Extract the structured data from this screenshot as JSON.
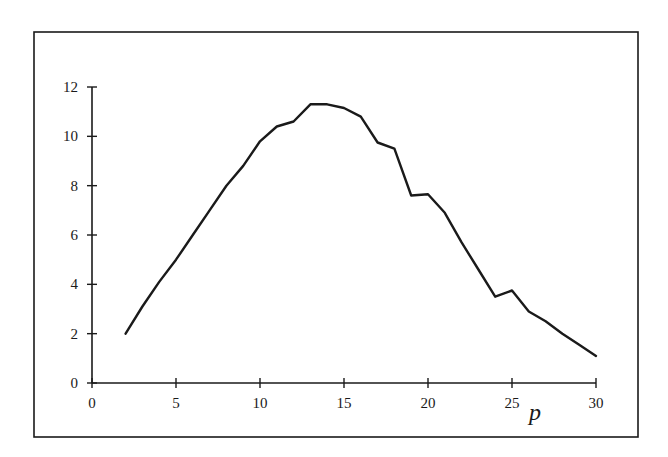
{
  "chart_data": {
    "type": "line",
    "title": "",
    "xlabel": "p",
    "ylabel": "",
    "xlim": [
      0,
      30
    ],
    "ylim": [
      0,
      12
    ],
    "grid": false,
    "legend": null,
    "x_ticks": [
      0,
      5,
      10,
      15,
      20,
      25,
      30
    ],
    "y_ticks": [
      0,
      2,
      4,
      6,
      8,
      10,
      12
    ],
    "x_tick_labels": [
      "0",
      "5",
      "10",
      "15",
      "20",
      "25",
      "30"
    ],
    "y_tick_labels": [
      "0",
      "2",
      "4",
      "6",
      "8",
      "10",
      "12"
    ],
    "series": [
      {
        "name": "curve",
        "color": "#1a1a1a",
        "x": [
          2,
          3,
          4,
          5,
          6,
          7,
          8,
          9,
          10,
          11,
          12,
          13,
          14,
          15,
          16,
          17,
          18,
          19,
          20,
          21,
          22,
          23,
          24,
          25,
          26,
          27,
          28,
          29,
          30
        ],
        "values": [
          2.0,
          3.1,
          4.1,
          5.0,
          6.0,
          7.0,
          8.0,
          8.8,
          9.8,
          10.4,
          10.6,
          11.3,
          11.3,
          11.15,
          10.8,
          9.75,
          9.5,
          7.6,
          7.65,
          6.9,
          5.7,
          4.6,
          3.5,
          3.75,
          2.9,
          2.5,
          2.0,
          1.55,
          1.1
        ]
      }
    ]
  },
  "layout": {
    "frame": {
      "x": 34,
      "y": 32,
      "w": 604,
      "h": 405
    },
    "plot": {
      "x0": 92,
      "y0": 383,
      "x1": 596,
      "y1": 87
    }
  }
}
